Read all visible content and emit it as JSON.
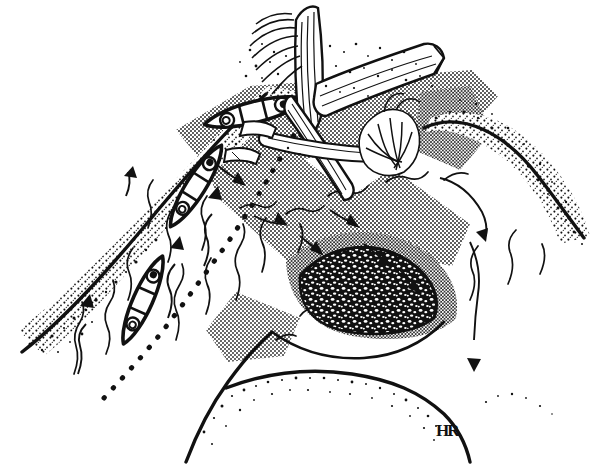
{
  "figure": {
    "domain": "natural-image",
    "medium": "pen-and-ink line drawing",
    "title": "River scene with canoes passing a logjam",
    "background_color": "#ffffff",
    "ink_color": "#111111",
    "width": 592,
    "height": 464
  },
  "signature": {
    "monogram": "HR",
    "position": "bottom-right",
    "x": 440,
    "y": 428
  },
  "legend_elements": [
    {
      "name": "canoe",
      "count": 3,
      "note": "each canoe carries two paddlers shown as small circles"
    },
    {
      "name": "logjam",
      "count": 1,
      "note": "tangle of tree trunks and driftwood across the upper channel"
    },
    {
      "name": "cobble-bar",
      "count": 1,
      "note": "dark stippled gravel bar mid-river"
    },
    {
      "name": "sand-bank",
      "count": 4,
      "note": "coarse stipple along the shorelines"
    },
    {
      "name": "shallow-band",
      "count": 3,
      "note": "halftone dot bands marking shallow crossing riffles"
    },
    {
      "name": "flow-arrow",
      "count": 7,
      "note": "downstream current arrows"
    },
    {
      "name": "travel-arrow",
      "count": 3,
      "note": "upstream canoe-route arrows"
    },
    {
      "name": "dotted-route",
      "count": 1,
      "note": "dotted line marking the canoe route"
    }
  ],
  "canoes": [
    {
      "id": 1,
      "label": "lead-canoe",
      "x": 255,
      "y": 112,
      "angle": -14,
      "paddlers": 2
    },
    {
      "id": 2,
      "label": "middle-canoe",
      "x": 196,
      "y": 186,
      "angle": -58,
      "paddlers": 2
    },
    {
      "id": 3,
      "label": "trailing-canoe",
      "x": 143,
      "y": 300,
      "angle": -66,
      "paddlers": 2
    }
  ],
  "features": {
    "logjam_label": "logjam",
    "cobble_bar_label": "cobble bar",
    "left_bank_label": "left bank",
    "right_bank_label": "right bank",
    "channel_label": "main channel"
  }
}
